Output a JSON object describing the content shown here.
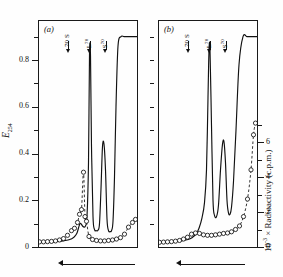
{
  "figure": {
    "panels": [
      {
        "letter": "(a)",
        "markers": [
          {
            "label_main": "70 S",
            "label_sup": "",
            "x_frac": 0.3
          },
          {
            "label_main": "L",
            "label_sup": "70",
            "x_frac": 0.515
          },
          {
            "label_main": "S",
            "label_sup": "70",
            "x_frac": 0.675
          }
        ]
      },
      {
        "letter": "(b)",
        "markers": [
          {
            "label_main": "70 S",
            "label_sup": "",
            "x_frac": 0.3
          },
          {
            "label_main": "L",
            "label_sup": "70",
            "x_frac": 0.515
          },
          {
            "label_main": "S",
            "label_sup": "70",
            "x_frac": 0.675
          }
        ]
      }
    ],
    "left_axis": {
      "title_main": "E",
      "title_sub": "254",
      "ticks": [
        "0.8",
        "0.6",
        "0.4",
        "0.2",
        "0"
      ],
      "tick_values": [
        0.8,
        0.6,
        0.4,
        0.2,
        0
      ],
      "range": [
        0,
        0.92
      ]
    },
    "right_axis": {
      "title_prefix": "10",
      "title_sup": "-3",
      "title_rest": " × Radioactivity (c.p.m.)",
      "ticks": [
        "6",
        "4",
        "2",
        "0"
      ],
      "tick_values": [
        6,
        4,
        2,
        0
      ],
      "range": [
        0,
        7.4
      ]
    },
    "direction_arrow": {
      "label": "",
      "direction": "left"
    }
  },
  "chart_data": {
    "type": "line",
    "title": "",
    "xlabel": "",
    "ylabel": "E_254",
    "y2label": "10^-3 x Radioactivity (c.p.m.)",
    "ylim": [
      0,
      0.92
    ],
    "y2lim": [
      0,
      7.4
    ],
    "grid": false,
    "legend": "none",
    "panels": [
      {
        "name": "(a)",
        "series": [
          {
            "name": "E254",
            "style": "solid",
            "x": [
              0.0,
              0.05,
              0.1,
              0.15,
              0.2,
              0.25,
              0.3,
              0.33,
              0.36,
              0.39,
              0.42,
              0.445,
              0.46,
              0.475,
              0.49,
              0.505,
              0.515,
              0.525,
              0.535,
              0.55,
              0.565,
              0.58,
              0.6,
              0.615,
              0.63,
              0.645,
              0.66,
              0.675,
              0.69,
              0.705,
              0.72,
              0.735,
              0.75,
              0.765,
              0.78,
              0.8,
              0.83,
              0.86,
              0.9,
              0.94,
              0.97,
              1.0
            ],
            "y": [
              0.02,
              0.02,
              0.021,
              0.022,
              0.024,
              0.026,
              0.03,
              0.034,
              0.042,
              0.06,
              0.1,
              0.09,
              0.085,
              0.09,
              0.13,
              0.36,
              0.82,
              0.82,
              0.43,
              0.13,
              0.075,
              0.07,
              0.072,
              0.1,
              0.25,
              0.43,
              0.44,
              0.33,
              0.12,
              0.07,
              0.066,
              0.07,
              0.11,
              0.3,
              0.6,
              0.86,
              0.9,
              0.9,
              0.9,
              0.9,
              0.9,
              0.9
            ]
          },
          {
            "name": "Radioactivity",
            "style": "dashed-markers",
            "x": [
              0.015,
              0.055,
              0.095,
              0.135,
              0.175,
              0.215,
              0.255,
              0.295,
              0.335,
              0.365,
              0.395,
              0.415,
              0.435,
              0.455,
              0.47,
              0.485,
              0.51,
              0.545,
              0.585,
              0.625,
              0.665,
              0.705,
              0.745,
              0.785,
              0.825,
              0.865,
              0.905,
              0.945,
              0.975
            ],
            "y": [
              0.022,
              0.022,
              0.023,
              0.024,
              0.026,
              0.03,
              0.036,
              0.05,
              0.07,
              0.08,
              0.105,
              0.14,
              0.16,
              0.32,
              0.13,
              0.11,
              0.045,
              0.032,
              0.028,
              0.026,
              0.026,
              0.028,
              0.03,
              0.034,
              0.04,
              0.055,
              0.085,
              0.105,
              0.118
            ]
          }
        ]
      },
      {
        "name": "(b)",
        "series": [
          {
            "name": "E254",
            "style": "solid",
            "x": [
              0.0,
              0.06,
              0.12,
              0.18,
              0.24,
              0.3,
              0.34,
              0.38,
              0.41,
              0.44,
              0.465,
              0.485,
              0.5,
              0.51,
              0.52,
              0.535,
              0.55,
              0.565,
              0.585,
              0.605,
              0.625,
              0.645,
              0.66,
              0.675,
              0.69,
              0.705,
              0.72,
              0.735,
              0.755,
              0.78,
              0.81,
              0.85,
              0.89,
              0.93,
              0.97,
              1.0
            ],
            "y": [
              0.02,
              0.021,
              0.022,
              0.024,
              0.027,
              0.032,
              0.04,
              0.055,
              0.08,
              0.125,
              0.19,
              0.33,
              0.64,
              0.84,
              0.845,
              0.52,
              0.2,
              0.135,
              0.13,
              0.18,
              0.33,
              0.44,
              0.45,
              0.36,
              0.2,
              0.145,
              0.14,
              0.17,
              0.28,
              0.5,
              0.78,
              0.9,
              0.9,
              0.9,
              0.9,
              0.9
            ]
          },
          {
            "name": "Radioactivity",
            "style": "dashed-markers",
            "x": [
              0.015,
              0.055,
              0.095,
              0.135,
              0.175,
              0.215,
              0.255,
              0.295,
              0.335,
              0.375,
              0.415,
              0.455,
              0.495,
              0.535,
              0.575,
              0.615,
              0.655,
              0.695,
              0.735,
              0.775,
              0.815,
              0.855,
              0.895,
              0.93,
              0.955,
              0.975
            ],
            "y": [
              0.02,
              0.021,
              0.022,
              0.023,
              0.025,
              0.028,
              0.034,
              0.042,
              0.055,
              0.06,
              0.058,
              0.052,
              0.05,
              0.05,
              0.052,
              0.055,
              0.058,
              0.06,
              0.065,
              0.075,
              0.09,
              0.13,
              0.205,
              0.33,
              0.48,
              0.53
            ]
          }
        ]
      }
    ]
  }
}
